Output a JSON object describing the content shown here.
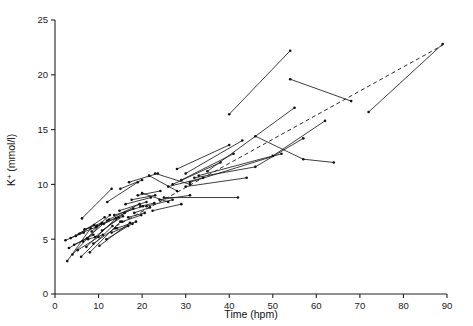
{
  "chart_data": {
    "type": "scatter",
    "title": "",
    "subtitle": "",
    "xlabel": "Time (hpm)",
    "ylabel": "K+ (mmol/l)",
    "ylabel_base": "K",
    "ylabel_sup": "+",
    "ylabel_units": " (mmol/l)",
    "xlim": [
      0,
      90
    ],
    "ylim": [
      0,
      25
    ],
    "xticks": [
      0,
      10,
      20,
      30,
      40,
      50,
      60,
      70,
      80,
      90
    ],
    "yticks": [
      0,
      5,
      10,
      15,
      20,
      25
    ],
    "xtick_labels": [
      "0",
      "10",
      "20",
      "30",
      "40",
      "50",
      "60",
      "70",
      "80",
      "90"
    ],
    "ytick_labels": [
      "0",
      "5",
      "10",
      "15",
      "20",
      "25"
    ],
    "grid": false,
    "legend": "none",
    "marker": "dot",
    "marker_radius": 1.3,
    "line_color": "#1b1b1b",
    "trend_color": "#2a2a2a",
    "trend_style": "dashed",
    "annotations": [],
    "trend": {
      "name": "regression line",
      "style": "dashed",
      "x": [
        14.0,
        89.0
      ],
      "y": [
        6.2,
        22.7
      ]
    },
    "series": [
      {
        "name": "case-01",
        "x": [
          2.4,
          6.6
        ],
        "y": [
          4.9,
          5.6
        ]
      },
      {
        "name": "case-02",
        "x": [
          2.8,
          8.2
        ],
        "y": [
          3.0,
          6.0
        ]
      },
      {
        "name": "case-03",
        "x": [
          3.2,
          7.4
        ],
        "y": [
          4.2,
          5.1
        ]
      },
      {
        "name": "case-04",
        "x": [
          3.6,
          9.0
        ],
        "y": [
          5.1,
          6.3
        ]
      },
      {
        "name": "case-05",
        "x": [
          4.0,
          10.6
        ],
        "y": [
          3.6,
          6.4
        ]
      },
      {
        "name": "case-06",
        "x": [
          4.4,
          8.8
        ],
        "y": [
          4.5,
          5.4
        ]
      },
      {
        "name": "case-07",
        "x": [
          4.8,
          11.4
        ],
        "y": [
          5.3,
          7.0
        ]
      },
      {
        "name": "case-08",
        "x": [
          5.2,
          10.0
        ],
        "y": [
          4.0,
          5.2
        ]
      },
      {
        "name": "case-09",
        "x": [
          5.6,
          9.4
        ],
        "y": [
          5.5,
          6.1
        ]
      },
      {
        "name": "case-10",
        "x": [
          6.0,
          13.2
        ],
        "y": [
          3.4,
          6.2
        ]
      },
      {
        "name": "case-11",
        "x": [
          6.4,
          12.0
        ],
        "y": [
          4.8,
          6.7
        ]
      },
      {
        "name": "case-12",
        "x": [
          6.8,
          10.8
        ],
        "y": [
          5.9,
          6.5
        ]
      },
      {
        "name": "case-13",
        "x": [
          7.2,
          14.0
        ],
        "y": [
          4.3,
          6.9
        ]
      },
      {
        "name": "case-14",
        "x": [
          7.6,
          11.0
        ],
        "y": [
          5.0,
          5.4
        ]
      },
      {
        "name": "case-15",
        "x": [
          8.0,
          15.0
        ],
        "y": [
          3.8,
          6.6
        ]
      },
      {
        "name": "case-16",
        "x": [
          8.4,
          12.6
        ],
        "y": [
          5.7,
          7.2
        ]
      },
      {
        "name": "case-17",
        "x": [
          8.8,
          13.8
        ],
        "y": [
          4.6,
          6.0
        ]
      },
      {
        "name": "case-18",
        "x": [
          9.2,
          16.0
        ],
        "y": [
          5.2,
          7.4
        ]
      },
      {
        "name": "case-19",
        "x": [
          9.6,
          14.6
        ],
        "y": [
          6.2,
          7.0
        ]
      },
      {
        "name": "case-20",
        "x": [
          10.2,
          17.2
        ],
        "y": [
          4.4,
          6.5
        ]
      },
      {
        "name": "case-21",
        "x": [
          10.8,
          15.6
        ],
        "y": [
          5.8,
          7.1
        ]
      },
      {
        "name": "case-22",
        "x": [
          11.2,
          18.0
        ],
        "y": [
          6.4,
          7.8
        ]
      },
      {
        "name": "case-23",
        "x": [
          11.8,
          16.8
        ],
        "y": [
          5.0,
          6.2
        ]
      },
      {
        "name": "case-24",
        "x": [
          12.4,
          19.4
        ],
        "y": [
          6.8,
          8.2
        ]
      },
      {
        "name": "case-25",
        "x": [
          13.0,
          17.8
        ],
        "y": [
          5.6,
          6.4
        ]
      },
      {
        "name": "case-26",
        "x": [
          13.6,
          20.2
        ],
        "y": [
          7.2,
          8.0
        ]
      },
      {
        "name": "case-27",
        "x": [
          14.2,
          18.6
        ],
        "y": [
          6.0,
          6.6
        ]
      },
      {
        "name": "case-28",
        "x": [
          14.8,
          21.0
        ],
        "y": [
          7.6,
          8.4
        ]
      },
      {
        "name": "case-29",
        "x": [
          15.4,
          19.8
        ],
        "y": [
          6.6,
          7.2
        ]
      },
      {
        "name": "case-30",
        "x": [
          16.2,
          22.0
        ],
        "y": [
          8.2,
          8.8
        ]
      },
      {
        "name": "case-31",
        "x": [
          16.8,
          20.6
        ],
        "y": [
          7.0,
          7.4
        ]
      },
      {
        "name": "case-32",
        "x": [
          17.6,
          23.0
        ],
        "y": [
          8.6,
          9.0
        ]
      },
      {
        "name": "case-33",
        "x": [
          18.2,
          21.8
        ],
        "y": [
          7.4,
          7.9
        ]
      },
      {
        "name": "case-34",
        "x": [
          19.0,
          24.2
        ],
        "y": [
          9.0,
          9.4
        ]
      },
      {
        "name": "case-35",
        "x": [
          19.6,
          22.8
        ],
        "y": [
          8.0,
          8.3
        ]
      },
      {
        "name": "case-36",
        "x": [
          6.2,
          13.0
        ],
        "y": [
          6.9,
          9.6
        ]
      },
      {
        "name": "case-37",
        "x": [
          12.0,
          19.0
        ],
        "y": [
          8.4,
          10.2
        ]
      },
      {
        "name": "case-38",
        "x": [
          15.0,
          20.0
        ],
        "y": [
          9.6,
          10.4
        ]
      },
      {
        "name": "case-39",
        "x": [
          17.0,
          23.6
        ],
        "y": [
          10.2,
          11.0
        ]
      },
      {
        "name": "case-40",
        "x": [
          20.0,
          26.0
        ],
        "y": [
          9.2,
          8.4
        ]
      },
      {
        "name": "case-41",
        "x": [
          21.0,
          27.0
        ],
        "y": [
          8.0,
          8.6
        ]
      },
      {
        "name": "case-42",
        "x": [
          22.4,
          29.0
        ],
        "y": [
          7.6,
          8.2
        ]
      },
      {
        "name": "case-43",
        "x": [
          24.0,
          31.0
        ],
        "y": [
          8.6,
          9.0
        ]
      },
      {
        "name": "case-44",
        "x": [
          25.0,
          42.0
        ],
        "y": [
          8.8,
          8.8
        ]
      },
      {
        "name": "case-45",
        "x": [
          26.0,
          34.0
        ],
        "y": [
          9.8,
          10.6
        ]
      },
      {
        "name": "case-46",
        "x": [
          23.0,
          31.0
        ],
        "y": [
          11.0,
          10.0
        ]
      },
      {
        "name": "case-47",
        "x": [
          27.0,
          38.0
        ],
        "y": [
          10.0,
          12.0
        ]
      },
      {
        "name": "case-48",
        "x": [
          29.0,
          41.0
        ],
        "y": [
          10.4,
          12.8
        ]
      },
      {
        "name": "case-49",
        "x": [
          30.0,
          43.0
        ],
        "y": [
          11.0,
          14.0
        ]
      },
      {
        "name": "case-50",
        "x": [
          28.0,
          40.0
        ],
        "y": [
          11.4,
          13.6
        ]
      },
      {
        "name": "case-51",
        "x": [
          31.0,
          52.0
        ],
        "y": [
          10.2,
          12.8
        ]
      },
      {
        "name": "case-52",
        "x": [
          32.0,
          46.0,
          57.0
        ],
        "y": [
          10.6,
          11.6,
          14.2
        ]
      },
      {
        "name": "case-53",
        "x": [
          33.0,
          50.0,
          62.0
        ],
        "y": [
          10.8,
          12.6,
          15.8
        ]
      },
      {
        "name": "case-54",
        "x": [
          35.0,
          55.0
        ],
        "y": [
          11.2,
          17.0
        ]
      },
      {
        "name": "case-55",
        "x": [
          40.0,
          54.0
        ],
        "y": [
          16.4,
          22.2
        ]
      },
      {
        "name": "case-56",
        "x": [
          46.0,
          57.0,
          64.0
        ],
        "y": [
          14.4,
          12.3,
          12.0
        ]
      },
      {
        "name": "case-57",
        "x": [
          54.0,
          68.0
        ],
        "y": [
          19.6,
          17.6
        ]
      },
      {
        "name": "case-58",
        "x": [
          72.0,
          89.0
        ],
        "y": [
          16.6,
          22.8
        ]
      },
      {
        "name": "case-59",
        "x": [
          30.0,
          44.0
        ],
        "y": [
          9.8,
          10.6
        ]
      },
      {
        "name": "case-60",
        "x": [
          21.6,
          28.0
        ],
        "y": [
          10.8,
          9.4
        ]
      }
    ]
  }
}
